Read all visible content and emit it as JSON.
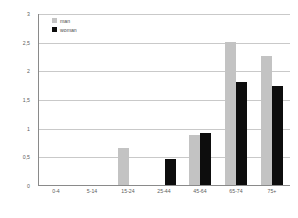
{
  "chart_data": {
    "type": "bar",
    "title": "",
    "subtitle": "",
    "xlabel": "",
    "ylabel": "",
    "categories": [
      "0-4",
      "5-14",
      "15-24",
      "25-44",
      "45-64",
      "65-74",
      "75+"
    ],
    "series": [
      {
        "name": "man",
        "color": "#c3c3c3",
        "values": [
          0,
          0,
          0.65,
          0,
          0.88,
          2.5,
          2.25
        ]
      },
      {
        "name": "woman",
        "color": "#0d0d0d",
        "values": [
          0,
          0,
          0,
          0.45,
          0.9,
          1.8,
          1.72
        ]
      }
    ],
    "ylim": [
      0,
      3
    ],
    "yticks": [
      0,
      0.5,
      1,
      1.5,
      2,
      2.5,
      3
    ],
    "ytick_labels": [
      "0",
      "0,5",
      "1",
      "1,5",
      "2",
      "2,5",
      "3"
    ],
    "grid": true,
    "legend_position": "top-left",
    "axis_color": "#8a8a8a",
    "grid_color": "#c9c9c9",
    "background": "#ffffff"
  }
}
